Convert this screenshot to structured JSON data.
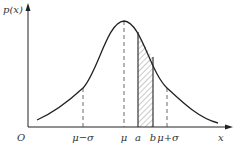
{
  "figure": {
    "y_axis_label": "p(x)",
    "x_axis_label": "x",
    "origin_label": "O",
    "ticks": [
      {
        "name": "mu-minus-sigma",
        "label": "μ−σ",
        "x": 83
      },
      {
        "name": "mu",
        "label": "μ",
        "x": 124
      },
      {
        "name": "a",
        "label": "a",
        "x": 138
      },
      {
        "name": "b",
        "label": "b",
        "x": 153
      },
      {
        "name": "mu-plus-sigma",
        "label": "μ+σ",
        "x": 167
      }
    ],
    "shaded_region": {
      "from": "a",
      "to": "b",
      "pattern": "diagonal-hatch"
    },
    "curve": "normal-distribution-density",
    "colors": {
      "line": "#222222",
      "hatch": "#555555",
      "background": "#ffffff"
    }
  }
}
